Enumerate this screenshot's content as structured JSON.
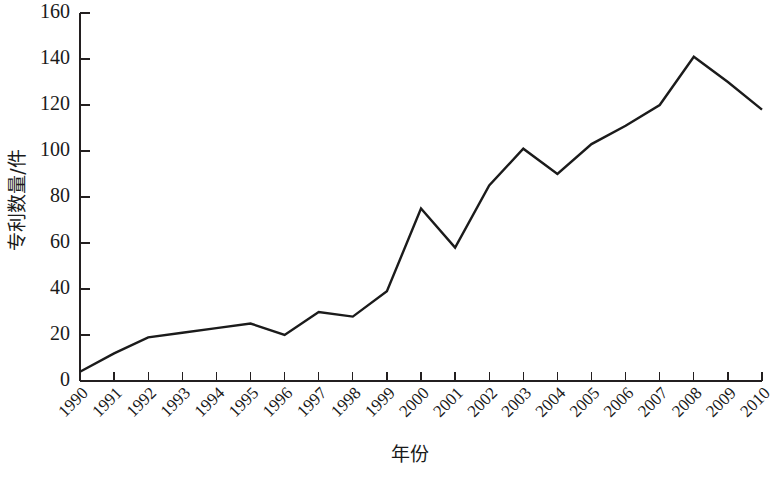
{
  "chart_data": {
    "type": "line",
    "title": "",
    "xlabel": "年份",
    "ylabel": "专利数量/件",
    "x": [
      1990,
      1991,
      1992,
      1993,
      1994,
      1995,
      1996,
      1997,
      1998,
      1999,
      2000,
      2001,
      2002,
      2003,
      2004,
      2005,
      2006,
      2007,
      2008,
      2009,
      2010
    ],
    "categories": [
      "1990",
      "1991",
      "1992",
      "1993",
      "1994",
      "1995",
      "1996",
      "1997",
      "1998",
      "1999",
      "2000",
      "2001",
      "2002",
      "2003",
      "2004",
      "2005",
      "2006",
      "2007",
      "2008",
      "2009",
      "2010"
    ],
    "values": [
      4,
      12,
      19,
      21,
      23,
      25,
      20,
      30,
      28,
      39,
      75,
      58,
      85,
      101,
      90,
      103,
      111,
      120,
      141,
      130,
      118
    ],
    "series": [
      {
        "name": "专利数量",
        "values": [
          4,
          12,
          19,
          21,
          23,
          25,
          20,
          30,
          28,
          39,
          75,
          58,
          85,
          101,
          90,
          103,
          111,
          120,
          141,
          130,
          118
        ]
      }
    ],
    "ylim": [
      0,
      160
    ],
    "yticks": [
      0,
      20,
      40,
      60,
      80,
      100,
      120,
      140,
      160
    ],
    "ytick_labels": [
      "0",
      "20",
      "40",
      "60",
      "80",
      "100",
      "120",
      "140",
      "160"
    ],
    "xlim": [
      1990,
      2010
    ],
    "grid": false,
    "legend": false,
    "legend_position": "none",
    "line_color": "#1b1b1b"
  },
  "axes": {
    "y_title": "专利数量/件",
    "x_title": "年份",
    "y_ticks": [
      "0",
      "20",
      "40",
      "60",
      "80",
      "100",
      "120",
      "140",
      "160"
    ],
    "x_ticks": [
      "1990",
      "1991",
      "1992",
      "1993",
      "1994",
      "1995",
      "1996",
      "1997",
      "1998",
      "1999",
      "2000",
      "2001",
      "2002",
      "2003",
      "2004",
      "2005",
      "2006",
      "2007",
      "2008",
      "2009",
      "2010"
    ]
  },
  "caption": {
    "text": ""
  }
}
